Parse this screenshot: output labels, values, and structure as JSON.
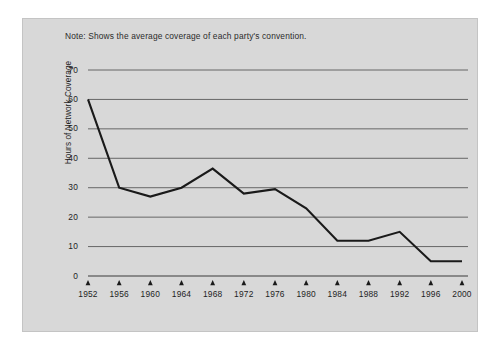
{
  "note": "Note: Shows the average coverage of each party's convention.",
  "colors": {
    "panel_background": "#d8d8d8",
    "page_background": "#ffffff",
    "gridline": "#5a5a5a",
    "data_line": "#1a1a1a",
    "text": "#1e1e1e"
  },
  "chart_data": {
    "type": "line",
    "title": "",
    "subtitle": "",
    "annotations": [
      "Note: Shows the average coverage of each party's convention."
    ],
    "xlabel": "",
    "ylabel": "Hours of Network Coverage",
    "categories": [
      "1952",
      "1956",
      "1960",
      "1964",
      "1968",
      "1972",
      "1976",
      "1980",
      "1984",
      "1988",
      "1992",
      "1996",
      "2000"
    ],
    "x": [
      1952,
      1956,
      1960,
      1964,
      1968,
      1972,
      1976,
      1980,
      1984,
      1988,
      1992,
      1996,
      2000
    ],
    "values": [
      60,
      30,
      27,
      30,
      36.5,
      28,
      29.5,
      23,
      12,
      12,
      15,
      5,
      5
    ],
    "series": [
      {
        "name": "Hours of Network Coverage",
        "values": [
          60,
          30,
          27,
          30,
          36.5,
          28,
          29.5,
          23,
          12,
          12,
          15,
          5,
          5
        ]
      }
    ],
    "ylim": [
      0,
      70
    ],
    "yticks": [
      0,
      10,
      20,
      30,
      40,
      50,
      60,
      70
    ],
    "ytick_labels": [
      "0",
      "10",
      "20",
      "30",
      "40",
      "50",
      "60",
      "70"
    ],
    "xtick_labels": [
      "1952",
      "1956",
      "1960",
      "1964",
      "1968",
      "1972",
      "1976",
      "1980",
      "1984",
      "1988",
      "1992",
      "1996",
      "2000"
    ],
    "grid": "horizontal",
    "legend": "none"
  }
}
